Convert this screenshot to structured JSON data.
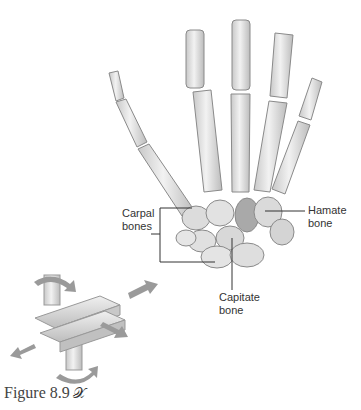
{
  "figure": {
    "caption": "Figure 8.9",
    "caption_icon": "dancer-icon",
    "caption_icon_glyph": "𝒳"
  },
  "labels": {
    "carpal": [
      "Carpal",
      "bones"
    ],
    "hamate": [
      "Hamate",
      "bone"
    ],
    "capitate": [
      "Capitate",
      "bone"
    ]
  },
  "colors": {
    "bone_fill": "#e4e4e4",
    "bone_stroke": "#8a8a8a",
    "bone_shade": "#bdbdbd",
    "leader_line": "#333333",
    "arrow_fill": "#9a9a9a",
    "joint_block": "#d6d6d6"
  }
}
